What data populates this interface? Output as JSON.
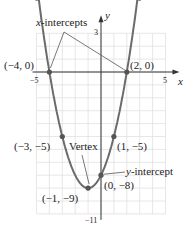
{
  "chart_data": {
    "type": "line",
    "title": "",
    "function": "y = x^2 + 2x - 8",
    "xlabel": "x",
    "ylabel": "y",
    "xlim": [
      -5,
      5
    ],
    "ylim": [
      -11,
      3
    ],
    "grid": true,
    "tick_labels": {
      "x": [
        "-5",
        "5"
      ],
      "y": [
        "3",
        "-11"
      ]
    },
    "points": [
      {
        "label": "(-4, 0)",
        "x": -4,
        "y": 0
      },
      {
        "label": "(2, 0)",
        "x": 2,
        "y": 0
      },
      {
        "label": "(-3, -5)",
        "x": -3,
        "y": -5
      },
      {
        "label": "(1, -5)",
        "x": 1,
        "y": -5
      },
      {
        "label": "(-1, -9)",
        "x": -1,
        "y": -9
      },
      {
        "label": "(0, -8)",
        "x": 0,
        "y": -8
      }
    ],
    "annotations": [
      "x-intercepts",
      "Vertex",
      "y-intercept"
    ]
  },
  "labels": {
    "x_intercepts": "x-intercepts",
    "vertex": "Vertex",
    "y_intercept": "y-intercept",
    "pt_m4_0": "(−4, 0)",
    "pt_2_0": "(2, 0)",
    "pt_m3_m5": "(−3, −5)",
    "pt_1_m5": "(1, −5)",
    "pt_m1_m9": "(−1, −9)",
    "pt_0_m8": "(0, −8)",
    "tick_xm5": "−5",
    "tick_x5": "5",
    "tick_y3": "3",
    "tick_ym11": "−11",
    "axis_x": "x",
    "axis_y": "y"
  },
  "colors": {
    "curve": "#6b6b6b",
    "grid": "#dcdcdc",
    "axis": "#333333",
    "point": "#555555"
  }
}
